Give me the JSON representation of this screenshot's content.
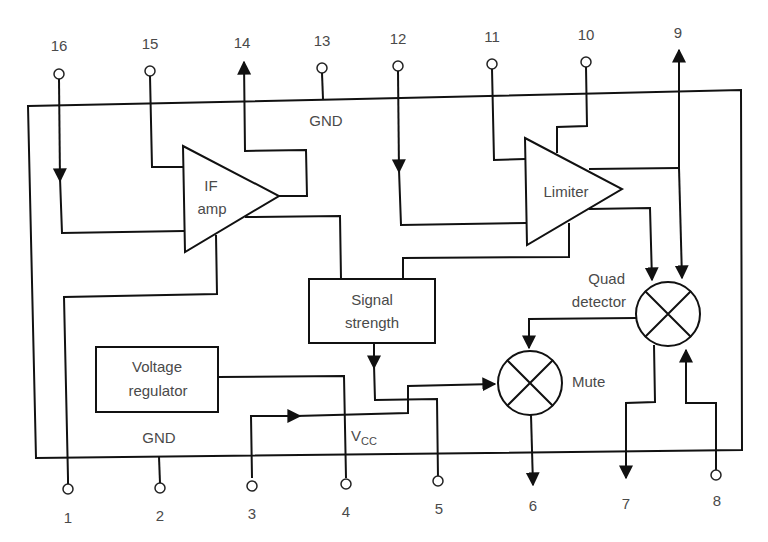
{
  "diagram": {
    "type": "IC functional block diagram (FM IF system)",
    "pins_top": [
      {
        "num": "16",
        "dir": "in"
      },
      {
        "num": "15",
        "dir": "in"
      },
      {
        "num": "14",
        "dir": "out"
      },
      {
        "num": "13",
        "dir": "gnd"
      },
      {
        "num": "12",
        "dir": "in"
      },
      {
        "num": "11",
        "dir": "in"
      },
      {
        "num": "10",
        "dir": "in"
      },
      {
        "num": "9",
        "dir": "out"
      }
    ],
    "pins_bottom": [
      {
        "num": "1",
        "dir": "in"
      },
      {
        "num": "2",
        "dir": "gnd"
      },
      {
        "num": "3",
        "dir": "in"
      },
      {
        "num": "4",
        "dir": "in"
      },
      {
        "num": "5",
        "dir": "in"
      },
      {
        "num": "6",
        "dir": "out"
      },
      {
        "num": "7",
        "dir": "out"
      },
      {
        "num": "8",
        "dir": "in"
      }
    ],
    "blocks": {
      "if_amp": {
        "line1": "IF",
        "line2": "amp"
      },
      "limiter": {
        "label": "Limiter"
      },
      "signal_strength": {
        "line1": "Signal",
        "line2": "strength"
      },
      "voltage_regulator": {
        "line1": "Voltage",
        "line2": "regulator"
      },
      "quad_detector": {
        "line1": "Quad",
        "line2": "detector"
      },
      "mute": {
        "label": "Mute"
      }
    },
    "labels": {
      "gnd_top": "GND",
      "gnd_bottom": "GND",
      "vcc_main": "V",
      "vcc_sub": "CC"
    }
  }
}
